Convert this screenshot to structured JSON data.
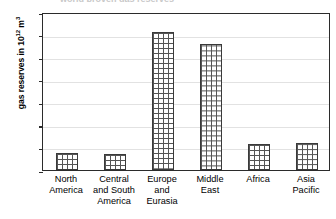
{
  "chart_data": {
    "type": "bar",
    "title": "",
    "title_remnant": "world proven gas reserves",
    "xlabel": "",
    "ylabel": "gas reserves in 10¹² m³",
    "ylabel_base": "gas reserves in 10",
    "ylabel_exponent": "12",
    "ylabel_unit": " m",
    "ylabel_unit_exponent": "3",
    "categories": [
      "North America",
      "Central and South America",
      "Europe and Eurasia",
      "Middle East",
      "Africa",
      "Asia Pacific"
    ],
    "category_lines": [
      [
        "North",
        "America"
      ],
      [
        "Central",
        "and South",
        "America"
      ],
      [
        "Europe",
        "and",
        "Eurasia"
      ],
      [
        "Middle",
        "East"
      ],
      [
        "Africa"
      ],
      [
        "Asia",
        "Pacific"
      ]
    ],
    "values": [
      7.5,
      7,
      61,
      56,
      11.5,
      12
    ],
    "ylim": [
      0,
      70
    ],
    "ytick_values": [
      0,
      10,
      20,
      30,
      40,
      50,
      60,
      70
    ],
    "ytick_labels": [
      "0",
      "10",
      "20",
      "30",
      "40",
      "50",
      "60",
      "70"
    ],
    "grid": true,
    "grid_axis": "y",
    "legend": false,
    "legend_position": "none",
    "bar_fill_pattern": "crosshatch-grid",
    "colors": {
      "axis": "#2b2b2b",
      "gridline": "#e2e2e2",
      "bar_border": "#3a3a3a",
      "bar_pattern": "#555555",
      "bar_fill": "#ffffff",
      "background": "#ffffff",
      "text": "#000000"
    }
  }
}
